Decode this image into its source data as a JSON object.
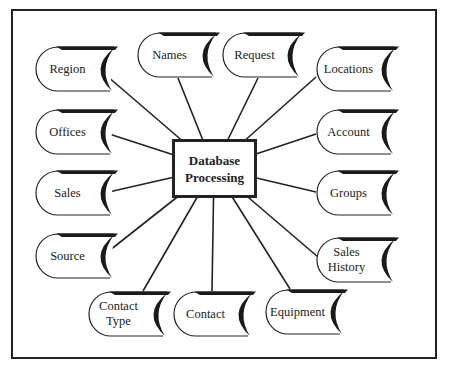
{
  "diagram": {
    "center": {
      "line1": "Database",
      "line2": "Processing",
      "x": 214,
      "y": 168
    },
    "nodes": [
      {
        "id": "region",
        "label": "Region",
        "x": 35,
        "y": 46,
        "w": 83,
        "h": 46,
        "anchor": [
          100,
          70
        ]
      },
      {
        "id": "names",
        "label": "Names",
        "x": 137,
        "y": 32,
        "w": 83,
        "h": 46,
        "anchor": [
          178,
          78
        ]
      },
      {
        "id": "request",
        "label": "Request",
        "x": 222,
        "y": 32,
        "w": 83,
        "h": 46,
        "anchor": [
          258,
          78
        ]
      },
      {
        "id": "locations",
        "label": "Locations",
        "x": 316,
        "y": 46,
        "w": 83,
        "h": 46,
        "anchor": [
          316,
          77
        ]
      },
      {
        "id": "offices",
        "label": "Offices",
        "x": 35,
        "y": 109,
        "w": 83,
        "h": 46,
        "anchor": [
          100,
          131
        ]
      },
      {
        "id": "account",
        "label": "Account",
        "x": 316,
        "y": 109,
        "w": 83,
        "h": 46,
        "anchor": [
          316,
          134
        ]
      },
      {
        "id": "sales",
        "label": "Sales",
        "x": 35,
        "y": 170,
        "w": 83,
        "h": 46,
        "anchor": [
          100,
          194
        ]
      },
      {
        "id": "groups",
        "label": "Groups",
        "x": 316,
        "y": 170,
        "w": 83,
        "h": 46,
        "anchor": [
          316,
          192
        ]
      },
      {
        "id": "source",
        "label": "Source",
        "x": 35,
        "y": 233,
        "w": 83,
        "h": 46,
        "anchor": [
          100,
          258
        ]
      },
      {
        "id": "sales-history",
        "label": "Sales History",
        "x": 316,
        "y": 237,
        "w": 83,
        "h": 46,
        "anchor": [
          318,
          257
        ]
      },
      {
        "id": "contact-type",
        "label": "Contact Type",
        "x": 88,
        "y": 291,
        "w": 83,
        "h": 46,
        "anchor": [
          143,
          291
        ]
      },
      {
        "id": "contact",
        "label": "Contact",
        "x": 173,
        "y": 291,
        "w": 83,
        "h": 46,
        "anchor": [
          212,
          291
        ]
      },
      {
        "id": "equipment",
        "label": "Equipment",
        "x": 265,
        "y": 289,
        "w": 83,
        "h": 46,
        "anchor": [
          290,
          289
        ]
      }
    ]
  }
}
